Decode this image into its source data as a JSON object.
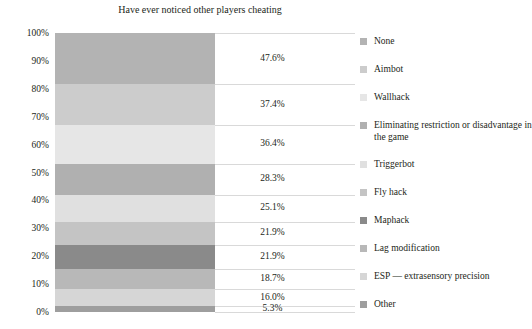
{
  "chart_data": {
    "type": "bar",
    "subtype": "stacked-bar-100",
    "title": "Have ever noticed other players cheating",
    "xlabel": "",
    "ylabel": "",
    "ylim": [
      0,
      100
    ],
    "ytick_labels": [
      "0%",
      "10%",
      "20%",
      "30%",
      "40%",
      "50%",
      "60%",
      "70%",
      "80%",
      "90%",
      "100%"
    ],
    "ytick_values": [
      0,
      10,
      20,
      30,
      40,
      50,
      60,
      70,
      80,
      90,
      100
    ],
    "grid": true,
    "legend_position": "right",
    "categories": [
      "None",
      "Aimbot",
      "Wallhack",
      "Eliminating restriction or disadvantage in the game",
      "Triggerbot",
      "Fly hack",
      "Maphack",
      "Lag modification",
      "ESP — extrasensory precision",
      "Other"
    ],
    "data_labels": [
      "47.6%",
      "37.4%",
      "36.4%",
      "28.3%",
      "25.1%",
      "21.9%",
      "21.9%",
      "18.7%",
      "16.0%",
      "5.3%"
    ],
    "values": [
      47.6,
      37.4,
      36.4,
      28.3,
      25.1,
      21.9,
      21.9,
      18.7,
      16.0,
      5.3
    ],
    "series": [
      {
        "name": "Have ever noticed other players cheating",
        "values": [
          47.6,
          37.4,
          36.4,
          28.3,
          25.1,
          21.9,
          21.9,
          18.7,
          16.0,
          5.3
        ]
      }
    ],
    "segment_colors": [
      "#b3b3b3",
      "#cccccc",
      "#e6e6e6",
      "#b0b0b0",
      "#e0e0e0",
      "#c4c4c4",
      "#8a8a8a",
      "#b8b8b8",
      "#d6d6d6",
      "#9e9e9e"
    ],
    "grid_color": "#d9d9d9",
    "text_color": "#231f20"
  },
  "chart": {
    "title": "Have ever noticed other players cheating"
  },
  "yaxis": {
    "ticks": [
      {
        "label": "100%",
        "value": 100
      },
      {
        "label": "90%",
        "value": 90
      },
      {
        "label": "80%",
        "value": 80
      },
      {
        "label": "70%",
        "value": 70
      },
      {
        "label": "60%",
        "value": 60
      },
      {
        "label": "50%",
        "value": 50
      },
      {
        "label": "40%",
        "value": 40
      },
      {
        "label": "30%",
        "value": 30
      },
      {
        "label": "20%",
        "value": 20
      },
      {
        "label": "10%",
        "value": 10
      },
      {
        "label": "0%",
        "value": 0
      }
    ]
  },
  "labels": [
    {
      "text": "47.6%",
      "value": 47.6
    },
    {
      "text": "37.4%",
      "value": 37.4
    },
    {
      "text": "36.4%",
      "value": 36.4
    },
    {
      "text": "28.3%",
      "value": 28.3
    },
    {
      "text": "25.1%",
      "value": 25.1
    },
    {
      "text": "21.9%",
      "value": 21.9
    },
    {
      "text": "21.9%",
      "value": 21.9
    },
    {
      "text": "18.7%",
      "value": 18.7
    },
    {
      "text": "16.0%",
      "value": 16.0
    },
    {
      "text": "5.3%",
      "value": 5.3
    }
  ],
  "legend": {
    "items": [
      {
        "label": "None",
        "color": "#b3b3b3"
      },
      {
        "label": "Aimbot",
        "color": "#cccccc"
      },
      {
        "label": "Wallhack",
        "color": "#e6e6e6"
      },
      {
        "label": "Eliminating restriction or disadvantage in the game",
        "color": "#b0b0b0"
      },
      {
        "label": "Triggerbot",
        "color": "#e0e0e0"
      },
      {
        "label": "Fly hack",
        "color": "#c4c4c4"
      },
      {
        "label": "Maphack",
        "color": "#8a8a8a"
      },
      {
        "label": "Lag modification",
        "color": "#b8b8b8"
      },
      {
        "label": "ESP — extrasensory precision",
        "color": "#d6d6d6"
      },
      {
        "label": "Other",
        "color": "#9e9e9e"
      }
    ]
  }
}
